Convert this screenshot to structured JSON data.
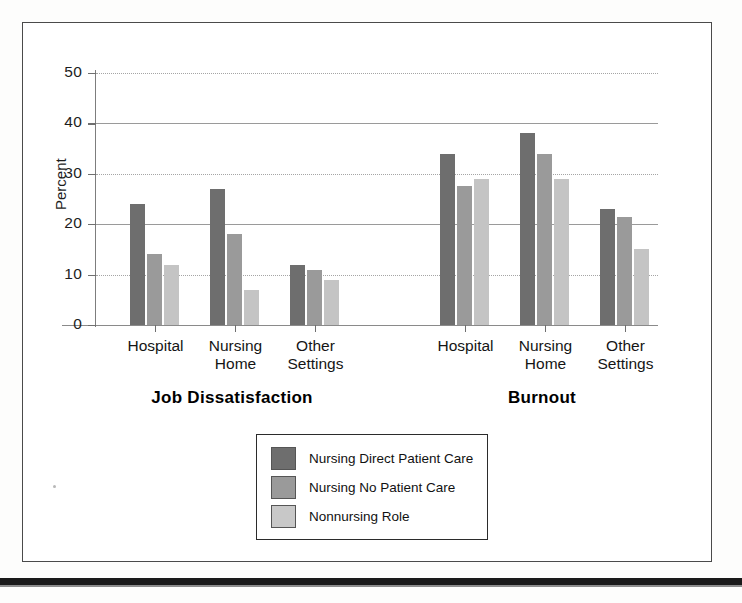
{
  "figure": {
    "y_axis_title": "Percent",
    "group_titles": [
      "Job Dissatisfaction",
      "Burnout"
    ]
  },
  "legend": {
    "items": [
      {
        "label": "Nursing Direct Patient Care",
        "color": "#6e6e6e",
        "swatch": "legend-swatch-dark"
      },
      {
        "label": "Nursing No Patient Care",
        "color": "#9a9a9a",
        "swatch": "legend-swatch-medium"
      },
      {
        "label": "Nonnursing Role",
        "color": "#c8c8c8",
        "swatch": "legend-swatch-light"
      }
    ]
  },
  "chart_data": {
    "type": "bar",
    "title": "",
    "subtitle": "",
    "xlabel": "",
    "ylabel": "Percent",
    "ylim": [
      0,
      50
    ],
    "yticks": [
      0,
      10,
      20,
      30,
      40,
      50
    ],
    "ytick_labels": [
      "0",
      "10",
      "20",
      "30",
      "40",
      "50"
    ],
    "grid": true,
    "legend_position": "bottom-center",
    "panels": [
      "Job Dissatisfaction",
      "Burnout"
    ],
    "categories": [
      "Hospital",
      "Nursing Home",
      "Other Settings"
    ],
    "category_label_lines": [
      [
        "Hospital",
        ""
      ],
      [
        "Nursing",
        "Home"
      ],
      [
        "Other",
        "Settings"
      ]
    ],
    "series": [
      {
        "name": "Nursing Direct Patient Care",
        "color": "#6e6e6e",
        "values": {
          "Job Dissatisfaction": [
            24,
            27,
            12
          ],
          "Burnout": [
            34,
            38,
            23
          ]
        }
      },
      {
        "name": "Nursing No Patient Care",
        "color": "#9a9a9a",
        "values": {
          "Job Dissatisfaction": [
            14,
            18,
            11
          ],
          "Burnout": [
            27.5,
            34,
            21.5
          ]
        }
      },
      {
        "name": "Nonnursing Role",
        "color": "#c8c8c8",
        "values": {
          "Job Dissatisfaction": [
            12,
            7,
            9
          ],
          "Burnout": [
            29,
            29,
            15
          ]
        }
      }
    ]
  }
}
